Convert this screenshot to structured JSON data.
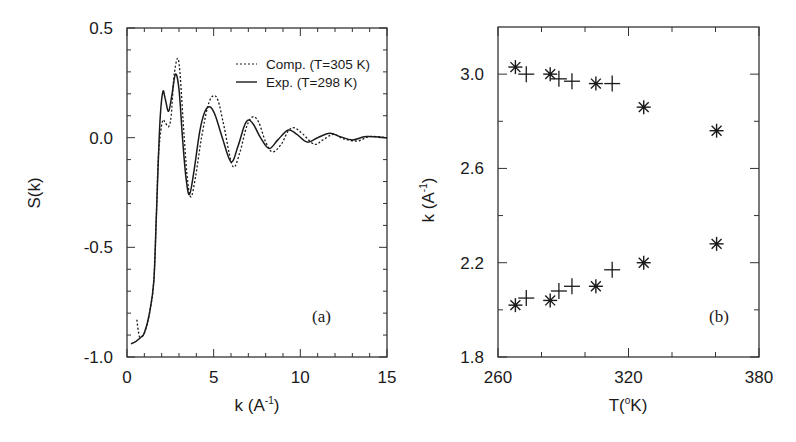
{
  "chart_data": [
    {
      "panel": "(a)",
      "type": "line",
      "title": "",
      "xlabel": "k (A-1)",
      "xlabel_base": "k (A",
      "xlabel_sup": "-1",
      "xlabel_close": ")",
      "ylabel": "S(k)",
      "xlim": [
        0,
        15
      ],
      "ylim": [
        -1.0,
        0.5
      ],
      "xticks": [
        0,
        5,
        10,
        15
      ],
      "xtick_labels": [
        "0",
        "5",
        "10",
        "15"
      ],
      "yticks": [
        -1.0,
        -0.5,
        0.0,
        0.5
      ],
      "ytick_labels": [
        "-1.0",
        "-0.5",
        "0.0",
        "0.5"
      ],
      "x_minor_step": 1,
      "y_minor_step": 0.1,
      "grid": false,
      "legend_position": "upper right",
      "annotation": "(a)",
      "series": [
        {
          "name": "Comp. (T=305 K)",
          "style": "dotted",
          "x": [
            0.57,
            0.65,
            0.75,
            1.0,
            1.3,
            1.55,
            1.7,
            1.8,
            1.95,
            2.07,
            2.2,
            2.4,
            2.55,
            2.7,
            2.9,
            3.05,
            3.3,
            3.5,
            3.7,
            3.95,
            4.3,
            4.65,
            4.95,
            5.25,
            5.6,
            6.1,
            6.5,
            6.9,
            7.25,
            7.6,
            8.0,
            8.4,
            8.9,
            9.3,
            9.65,
            10.1,
            10.8,
            11.3,
            11.9,
            12.5,
            13.3,
            14.0,
            15.0
          ],
          "y": [
            -0.83,
            -0.88,
            -0.91,
            -0.89,
            -0.8,
            -0.65,
            -0.34,
            -0.1,
            0.03,
            0.08,
            0.07,
            0.05,
            0.1,
            0.27,
            0.36,
            0.3,
            0.0,
            -0.2,
            -0.27,
            -0.18,
            0.0,
            0.14,
            0.19,
            0.17,
            0.05,
            -0.13,
            -0.07,
            0.05,
            0.095,
            0.07,
            -0.02,
            -0.065,
            -0.03,
            0.03,
            0.045,
            0.02,
            -0.03,
            -0.01,
            0.015,
            -0.005,
            -0.015,
            0.005,
            0.0
          ]
        },
        {
          "name": "Exp. (T=298 K)",
          "style": "solid",
          "x": [
            0.23,
            0.5,
            0.8,
            1.0,
            1.3,
            1.55,
            1.7,
            1.8,
            1.92,
            2.07,
            2.2,
            2.4,
            2.6,
            2.8,
            3.0,
            3.2,
            3.4,
            3.6,
            3.85,
            4.2,
            4.5,
            4.8,
            5.1,
            5.5,
            6.0,
            6.4,
            6.75,
            7.0,
            7.3,
            7.7,
            8.2,
            8.7,
            9.3,
            9.8,
            10.4,
            11.0,
            11.7,
            12.3,
            13.0,
            13.8,
            15.0
          ],
          "y": [
            -0.94,
            -0.93,
            -0.91,
            -0.89,
            -0.8,
            -0.65,
            -0.34,
            -0.12,
            0.1,
            0.21,
            0.18,
            0.12,
            0.2,
            0.29,
            0.22,
            0.0,
            -0.18,
            -0.26,
            -0.16,
            0.03,
            0.12,
            0.14,
            0.1,
            0.0,
            -0.11,
            -0.04,
            0.05,
            0.08,
            0.06,
            0.0,
            -0.05,
            -0.01,
            0.035,
            0.015,
            -0.02,
            0.0,
            0.02,
            0.005,
            -0.01,
            0.005,
            0.0
          ]
        }
      ]
    },
    {
      "panel": "(b)",
      "type": "scatter",
      "title": "",
      "xlabel": "T(oK)",
      "xlabel_base": "T(",
      "xlabel_sup": "o",
      "xlabel_close": "K)",
      "ylabel": "k (A-1)",
      "ylabel_base": "k (A",
      "ylabel_sup": "-1",
      "ylabel_close": ")",
      "xlim": [
        260,
        380
      ],
      "ylim": [
        1.8,
        3.2
      ],
      "xticks": [
        260,
        320,
        380
      ],
      "xtick_labels": [
        "260",
        "320",
        "380"
      ],
      "x_minor_ticks": [
        280,
        300,
        340,
        360
      ],
      "yticks": [
        1.8,
        2.2,
        2.6,
        3.0
      ],
      "ytick_labels": [
        "1.8",
        "2.2",
        "2.6",
        "3.0"
      ],
      "y_minor_ticks": [
        2.0,
        2.4,
        2.8
      ],
      "grid": false,
      "annotation": "(b)",
      "series": [
        {
          "name": "asterisk markers",
          "marker": "asterisk",
          "points": [
            [
              268,
              3.03
            ],
            [
              284,
              3.0
            ],
            [
              305,
              2.96
            ],
            [
              327,
              2.86
            ],
            [
              360.5,
              2.76
            ],
            [
              268,
              2.02
            ],
            [
              284,
              2.04
            ],
            [
              305,
              2.1
            ],
            [
              327,
              2.2
            ],
            [
              360.5,
              2.28
            ]
          ]
        },
        {
          "name": "plus markers",
          "marker": "plus",
          "points": [
            [
              273,
              3.0
            ],
            [
              288,
              2.98
            ],
            [
              294,
              2.97
            ],
            [
              312.5,
              2.96
            ],
            [
              273,
              2.05
            ],
            [
              288,
              2.08
            ],
            [
              294,
              2.1
            ],
            [
              312.5,
              2.17
            ]
          ]
        }
      ]
    }
  ],
  "layout": {
    "panel_a": {
      "left": 127,
      "top": 28,
      "right": 387,
      "bottom": 357
    },
    "panel_b": {
      "left": 498,
      "top": 27,
      "right": 759,
      "bottom": 357
    },
    "ink_color": "#1a1a1a",
    "background": "#ffffff"
  }
}
